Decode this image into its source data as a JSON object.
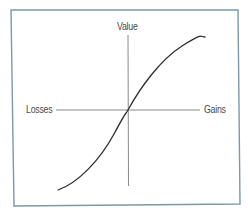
{
  "figure": {
    "type": "value-function-diagram",
    "frame_color": "#7b99a6",
    "axis_color": "#8a8a8a",
    "curve_color": "#2e2e2e",
    "background": "#ffffff"
  },
  "labels": {
    "y_axis": "Value",
    "x_axis_negative": "Losses",
    "x_axis_positive": "Gains"
  },
  "axes": {
    "origin": [
      128,
      110
    ],
    "x_axis": {
      "from": [
        56,
        110
      ],
      "to": [
        200,
        110
      ]
    },
    "y_axis": {
      "from": [
        128,
        35
      ],
      "to": [
        128,
        186
      ]
    }
  },
  "curve": {
    "description": "S-shaped value function: concave for gains, convex for losses, passing through origin",
    "points": [
      [
        58,
        190
      ],
      [
        70,
        184
      ],
      [
        85,
        172
      ],
      [
        98,
        157
      ],
      [
        110,
        140
      ],
      [
        120,
        123
      ],
      [
        128,
        110
      ],
      [
        138,
        92
      ],
      [
        155,
        68
      ],
      [
        175,
        50
      ],
      [
        192,
        40
      ],
      [
        205,
        37
      ]
    ]
  }
}
